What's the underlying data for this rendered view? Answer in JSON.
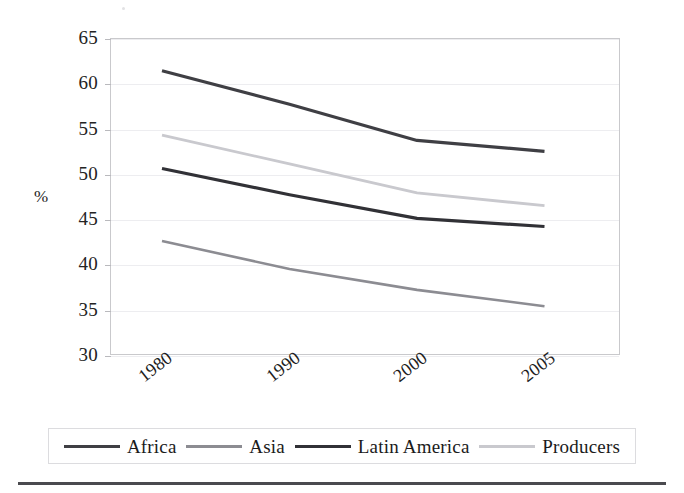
{
  "chart_data": {
    "type": "line",
    "title": "",
    "subtitle": "",
    "xlabel": "",
    "ylabel": "%",
    "categories": [
      "1980",
      "1990",
      "2000",
      "2005"
    ],
    "x_positions_pct": [
      10.0,
      35.0,
      60.0,
      85.0
    ],
    "ylim": [
      30,
      65
    ],
    "yticks": [
      30,
      35,
      40,
      45,
      50,
      55,
      60,
      65
    ],
    "ytick_labels": [
      "30",
      "35",
      "40",
      "45",
      "50",
      "55",
      "60",
      "65"
    ],
    "grid": true,
    "legend_position": "bottom",
    "series": [
      {
        "name": "Africa",
        "color": "#3f3f44",
        "width": 3.2,
        "values": [
          61.5,
          57.8,
          53.8,
          52.6
        ]
      },
      {
        "name": "Asia",
        "color": "#8c8c92",
        "width": 2.6,
        "values": [
          42.7,
          39.6,
          37.3,
          35.5
        ]
      },
      {
        "name": "Latin America",
        "color": "#313136",
        "width": 3.2,
        "values": [
          50.7,
          47.8,
          45.2,
          44.3
        ]
      },
      {
        "name": "Producers",
        "color": "#c9c9ce",
        "width": 2.8,
        "values": [
          54.4,
          51.2,
          48.0,
          46.6
        ]
      }
    ]
  },
  "axes": {
    "y_axis_title": "%",
    "x_tick_labels": [
      "1980",
      "1990",
      "2000",
      "2005"
    ],
    "y_tick_labels": [
      "65",
      "60",
      "55",
      "50",
      "45",
      "40",
      "35",
      "30"
    ]
  },
  "legend": {
    "items": [
      {
        "label": "Africa",
        "color": "#3f3f44"
      },
      {
        "label": "Asia",
        "color": "#8c8c92"
      },
      {
        "label": "Latin America",
        "color": "#313136"
      },
      {
        "label": "Producers",
        "color": "#c9c9ce"
      }
    ]
  },
  "colors": {
    "plot_border": "#c9c9cc",
    "gridline": "#ededf0",
    "legend_border": "#dcdcdf",
    "bottom_rule": "#4a4a4f",
    "text": "#1b1b1b",
    "background": "#ffffff"
  }
}
